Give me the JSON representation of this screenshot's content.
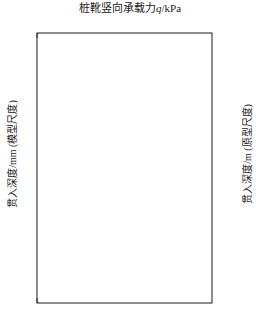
{
  "chart_data": {
    "type": "line",
    "title": "桩靴竖向承载力q/kPa",
    "title_parts": {
      "main": "桩靴竖向承载力",
      "symbol": "q",
      "unit": "/kPa"
    },
    "xlabel": "桩靴竖向承载力q/kPa",
    "ylabel": "贯入深度/mm (模型尺度)",
    "ylabel_right": "贯入深度/m (原型尺度)",
    "x_axis_position": "top",
    "xlim": [
      0,
      800
    ],
    "xticks": [
      0,
      200,
      400,
      600,
      800
    ],
    "xtick_labels": [
      "0",
      "200",
      "400",
      "600",
      "800"
    ],
    "x_minor_tick_interval": 50,
    "ylim": [
      0,
      100
    ],
    "yticks": [
      0,
      10,
      20,
      30,
      40,
      50,
      60,
      70,
      80,
      90,
      100
    ],
    "ytick_labels": [
      "0",
      "10",
      "20",
      "30",
      "40",
      "50",
      "60",
      "70",
      "80",
      "90",
      "100"
    ],
    "y_minor_tick_interval": 2.5,
    "ylim_right": [
      0,
      10
    ],
    "yticks_right": [
      0,
      1,
      2,
      3,
      4,
      5,
      6,
      7,
      8,
      9,
      10
    ],
    "ytick_labels_right": [
      "0",
      "1",
      "2",
      "3",
      "4",
      "5",
      "6",
      "7",
      "8",
      "9",
      "10"
    ],
    "y_inverted": true,
    "grid": false,
    "legend": "none",
    "line_color": "#444444",
    "line_width": 1.2,
    "reference_line": {
      "orientation": "horizontal",
      "y_model_mm": 50,
      "y_prototype_m": 5,
      "style": "dashed",
      "color": "#333333"
    },
    "series": [
      {
        "name": "桩靴贯入阻力曲线",
        "x_name": "q/kPa",
        "y_name": "贯入深度/mm",
        "points": [
          [
            0,
            0
          ],
          [
            14,
            1.2
          ],
          [
            26,
            2.6
          ],
          [
            36,
            4.3
          ],
          [
            42,
            6.0
          ],
          [
            44,
            7.6
          ],
          [
            45,
            9.0
          ],
          [
            50,
            10.4
          ],
          [
            62,
            11.6
          ],
          [
            85,
            12.6
          ],
          [
            120,
            13.6
          ],
          [
            175,
            14.6
          ],
          [
            245,
            15.6
          ],
          [
            320,
            16.5
          ],
          [
            395,
            17.3
          ],
          [
            455,
            18.0
          ],
          [
            500,
            18.6
          ],
          [
            528,
            19.1
          ],
          [
            540,
            19.6
          ],
          [
            536,
            20.2
          ],
          [
            520,
            20.8
          ],
          [
            500,
            21.4
          ],
          [
            486,
            22.0
          ],
          [
            480,
            22.6
          ],
          [
            486,
            23.2
          ],
          [
            494,
            23.8
          ],
          [
            488,
            24.4
          ],
          [
            470,
            25.2
          ],
          [
            448,
            26.0
          ],
          [
            432,
            26.8
          ],
          [
            424,
            27.6
          ],
          [
            430,
            28.4
          ],
          [
            438,
            29.2
          ],
          [
            430,
            30.0
          ],
          [
            412,
            30.9
          ],
          [
            398,
            31.8
          ],
          [
            392,
            32.6
          ],
          [
            398,
            33.4
          ],
          [
            404,
            34.2
          ],
          [
            396,
            35.0
          ],
          [
            382,
            35.9
          ],
          [
            372,
            36.8
          ],
          [
            368,
            37.7
          ],
          [
            374,
            38.6
          ],
          [
            382,
            39.4
          ],
          [
            386,
            40.2
          ],
          [
            394,
            41.0
          ],
          [
            406,
            41.7
          ],
          [
            414,
            42.3
          ],
          [
            408,
            43.0
          ],
          [
            396,
            43.8
          ],
          [
            388,
            44.7
          ],
          [
            386,
            45.8
          ],
          [
            392,
            47.0
          ],
          [
            402,
            48.3
          ],
          [
            414,
            49.5
          ],
          [
            424,
            50.6
          ],
          [
            430,
            51.8
          ],
          [
            430,
            53.0
          ],
          [
            424,
            54.3
          ],
          [
            414,
            55.7
          ],
          [
            404,
            57.2
          ],
          [
            396,
            58.8
          ],
          [
            390,
            60.4
          ],
          [
            386,
            62.0
          ],
          [
            384,
            63.6
          ],
          [
            384,
            65.2
          ],
          [
            386,
            66.8
          ],
          [
            392,
            68.3
          ],
          [
            402,
            69.7
          ],
          [
            416,
            71.0
          ],
          [
            432,
            72.2
          ],
          [
            448,
            73.3
          ],
          [
            462,
            74.4
          ],
          [
            472,
            75.5
          ],
          [
            478,
            76.7
          ],
          [
            480,
            78.0
          ],
          [
            482,
            79.3
          ],
          [
            490,
            80.6
          ],
          [
            504,
            82.0
          ],
          [
            522,
            83.5
          ],
          [
            544,
            85.0
          ],
          [
            566,
            86.6
          ],
          [
            588,
            88.2
          ],
          [
            608,
            89.9
          ],
          [
            624,
            91.6
          ],
          [
            636,
            93.3
          ],
          [
            644,
            95.0
          ],
          [
            648,
            96.6
          ],
          [
            650,
            98.2
          ],
          [
            650,
            100
          ]
        ]
      }
    ],
    "annotations": [
      {
        "label": "(A)",
        "point_q": 48,
        "point_depth_mm": 8.5,
        "text_x": 75,
        "text_y": 65,
        "arrow_from_x": 70,
        "arrow_to_x": 50,
        "arrow_y": 65
      },
      {
        "label": "(B)",
        "point_q": 540,
        "point_depth_mm": 19.8,
        "text_x": 190,
        "text_y": 88,
        "arrow_from_x": 185,
        "arrow_to_x": 167,
        "arrow_y": 88
      },
      {
        "label": "(C)",
        "point_q": 400,
        "point_depth_mm": 33.0,
        "text_x": 152,
        "text_y": 123,
        "arrow_from_x": 147,
        "arrow_to_x": 130,
        "arrow_y": 123
      },
      {
        "label": "(D)",
        "point_q": 412,
        "point_depth_mm": 41.8,
        "text_x": 155,
        "text_y": 148,
        "arrow_from_x": 150,
        "arrow_to_x": 131,
        "arrow_y": 148
      },
      {
        "label": "(E)",
        "point_q": 425,
        "point_depth_mm": 58.5,
        "text_x": 140,
        "text_y": 197,
        "arrow_from_x": 135,
        "arrow_to_x": 117,
        "arrow_y": 197
      },
      {
        "label": "(F)",
        "point_q": 470,
        "point_depth_mm": 76.5,
        "text_x": 160,
        "text_y": 248,
        "arrow_from_x": 155,
        "arrow_to_x": 136,
        "arrow_y": 248
      }
    ]
  }
}
